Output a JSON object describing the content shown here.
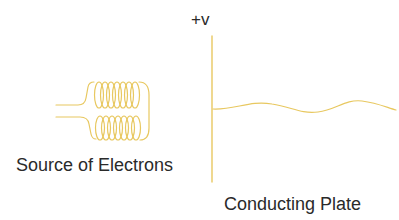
{
  "diagram": {
    "voltage_label": "+v",
    "source_label": "Source of Electrons",
    "plate_label": "Conducting Plate",
    "stroke_color": "#e8c860",
    "text_color": "#2a2a2a",
    "components": [
      {
        "id": "filament-coil",
        "type": "coil",
        "turns_top": 7,
        "turns_bottom": 7
      },
      {
        "id": "conducting-plate",
        "type": "vertical-line"
      },
      {
        "id": "electron-beam",
        "type": "wave"
      }
    ]
  }
}
